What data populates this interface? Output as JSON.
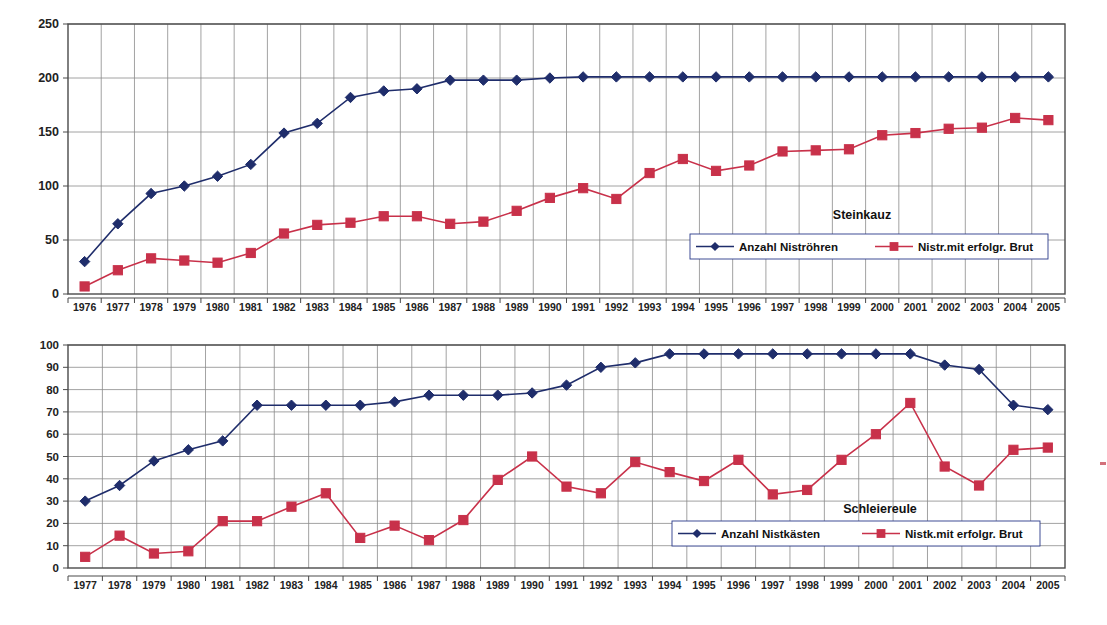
{
  "page": {
    "background": "#ffffff",
    "series_colors": {
      "nest_total": "#1f2d6b",
      "successful_brood": "#c8314a"
    },
    "gridline_color": "#8a8a8a",
    "axis_color": "#4a4a4a"
  },
  "chart_data": [
    {
      "type": "line",
      "id": "steinkauz",
      "title": "Steinkauz",
      "xlabel": "",
      "ylabel": "",
      "ylim": [
        0,
        250
      ],
      "yticks": [
        0,
        50,
        100,
        150,
        200,
        250
      ],
      "grid": true,
      "legend_position": "inside-bottom-right",
      "categories": [
        "1976",
        "1977",
        "1978",
        "1979",
        "1980",
        "1981",
        "1982",
        "1983",
        "1984",
        "1985",
        "1986",
        "1987",
        "1988",
        "1989",
        "1990",
        "1991",
        "1992",
        "1993",
        "1994",
        "1995",
        "1996",
        "1997",
        "1998",
        "1999",
        "2000",
        "2001",
        "2002",
        "2003",
        "2004",
        "2005"
      ],
      "series": [
        {
          "name": "Anzahl Niströhren",
          "color": "#1f2d6b",
          "marker": "diamond",
          "values": [
            30,
            65,
            93,
            100,
            109,
            120,
            149,
            158,
            182,
            188,
            190,
            198,
            198,
            198,
            200,
            201,
            201,
            201,
            201,
            201,
            201,
            201,
            201,
            201,
            201,
            201,
            201,
            201,
            201,
            201
          ]
        },
        {
          "name": "Nistr.mit erfolgr. Brut",
          "color": "#c8314a",
          "marker": "square",
          "values": [
            7,
            22,
            33,
            31,
            29,
            38,
            56,
            64,
            66,
            72,
            72,
            65,
            67,
            77,
            89,
            98,
            88,
            112,
            125,
            114,
            119,
            132,
            133,
            134,
            147,
            149,
            153,
            154,
            163,
            161
          ]
        }
      ]
    },
    {
      "type": "line",
      "id": "schleiereule",
      "title": "Schleiereule",
      "xlabel": "",
      "ylabel": "",
      "ylim": [
        0,
        100
      ],
      "yticks": [
        0,
        10,
        20,
        30,
        40,
        50,
        60,
        70,
        80,
        90,
        100
      ],
      "grid": true,
      "legend_position": "inside-bottom-right",
      "categories": [
        "1977",
        "1978",
        "1979",
        "1980",
        "1981",
        "1982",
        "1983",
        "1984",
        "1985",
        "1986",
        "1987",
        "1988",
        "1989",
        "1990",
        "1991",
        "1992",
        "1993",
        "1994",
        "1995",
        "1996",
        "1997",
        "1998",
        "1999",
        "2000",
        "2001",
        "2002",
        "2003",
        "2004",
        "2005"
      ],
      "series": [
        {
          "name": "Anzahl Nistkästen",
          "color": "#1f2d6b",
          "marker": "diamond",
          "values": [
            30,
            37,
            48,
            53,
            57,
            73,
            73,
            73,
            73,
            74.5,
            77.5,
            77.5,
            77.5,
            78.5,
            82,
            90,
            92,
            96,
            96,
            96,
            96,
            96,
            96,
            96,
            96,
            91,
            89,
            73,
            71
          ]
        },
        {
          "name": "Nistk.mit erfolgr. Brut",
          "color": "#c8314a",
          "marker": "square",
          "values": [
            5,
            14.5,
            6.5,
            7.5,
            21,
            21,
            27.5,
            33.5,
            13.5,
            19,
            12.5,
            21.5,
            39.5,
            50,
            36.5,
            33.5,
            47.5,
            43,
            39,
            48.5,
            33,
            35,
            48.5,
            60,
            74,
            45.5,
            37,
            53,
            54
          ]
        }
      ]
    }
  ]
}
